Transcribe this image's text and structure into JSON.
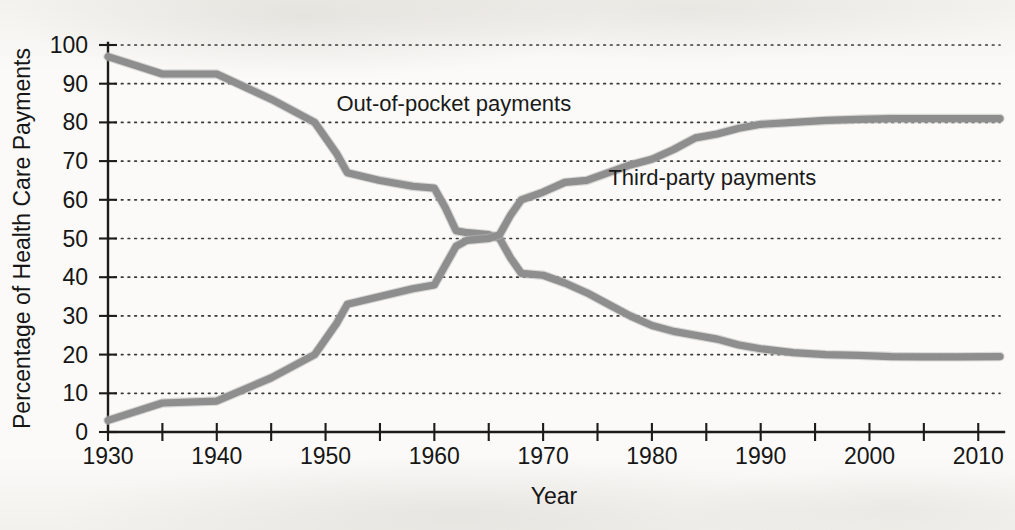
{
  "figure": {
    "background_color": "#f8f7f4",
    "line_color": "#8e8e8e",
    "axis_color": "#1b1b1b",
    "text_color": "#161616"
  },
  "chart_data": {
    "type": "line",
    "title": "",
    "xlabel": "Year",
    "ylabel": "Percentage of Health Care Payments",
    "xlim": [
      1930,
      2012
    ],
    "ylim": [
      0,
      100
    ],
    "grid": true,
    "grid_style": "dotted horizontal",
    "legend_position": "inline-annotations",
    "xticks": [
      1930,
      1935,
      1940,
      1945,
      1950,
      1955,
      1960,
      1965,
      1970,
      1975,
      1980,
      1985,
      1990,
      1995,
      2000,
      2005,
      2010
    ],
    "xtick_labels": [
      "1930",
      "",
      "1940",
      "",
      "1950",
      "",
      "1960",
      "",
      "1970",
      "",
      "1980",
      "",
      "1990",
      "",
      "2000",
      "",
      "2010"
    ],
    "xtick_labels_shown": [
      "1930",
      "1940",
      "1950",
      "1960",
      "1970",
      "1980",
      "1990",
      "2000",
      "2010"
    ],
    "yticks": [
      0,
      10,
      20,
      30,
      40,
      50,
      60,
      70,
      80,
      90,
      100
    ],
    "ytick_labels": [
      "0",
      "10",
      "20",
      "30",
      "40",
      "50",
      "60",
      "70",
      "80",
      "90",
      "100"
    ],
    "series": [
      {
        "name": "Out-of-pocket payments",
        "label_x": 1951,
        "label_y": 85,
        "x": [
          1930,
          1935,
          1940,
          1945,
          1949,
          1951,
          1952,
          1955,
          1958,
          1960,
          1961,
          1962,
          1963,
          1965,
          1966,
          1967,
          1968,
          1970,
          1972,
          1974,
          1976,
          1978,
          1980,
          1982,
          1984,
          1986,
          1988,
          1990,
          1993,
          1996,
          1999,
          2002,
          2005,
          2008,
          2012
        ],
        "values": [
          97,
          92.5,
          92.5,
          86,
          80,
          72,
          67,
          65,
          63.5,
          63,
          58,
          52,
          51.5,
          51,
          50,
          45,
          41,
          40.5,
          38.5,
          36,
          33,
          30,
          27.5,
          26,
          25,
          24,
          22.5,
          21.5,
          20.5,
          20,
          19.8,
          19.5,
          19.4,
          19.4,
          19.5
        ]
      },
      {
        "name": "Third-party payments",
        "label_x": 1976,
        "label_y": 66,
        "x": [
          1930,
          1935,
          1940,
          1945,
          1949,
          1951,
          1952,
          1955,
          1958,
          1960,
          1961,
          1962,
          1963,
          1965,
          1966,
          1967,
          1968,
          1970,
          1972,
          1974,
          1976,
          1978,
          1980,
          1982,
          1984,
          1986,
          1988,
          1990,
          1993,
          1996,
          1999,
          2002,
          2005,
          2008,
          2012
        ],
        "values": [
          3,
          7.5,
          8,
          14,
          20,
          28,
          33,
          35,
          37,
          38,
          43,
          48,
          49.5,
          50,
          51,
          56,
          60,
          62,
          64.5,
          65,
          67,
          69,
          70.5,
          73,
          76,
          77,
          78.5,
          79.5,
          80,
          80.5,
          80.8,
          81,
          81,
          81,
          81
        ]
      }
    ]
  },
  "labels": {
    "y_axis_title": "Percentage of Health Care Payments",
    "x_axis_title": "Year",
    "series_out_of_pocket": "Out-of-pocket payments",
    "series_third_party": "Third-party payments"
  }
}
